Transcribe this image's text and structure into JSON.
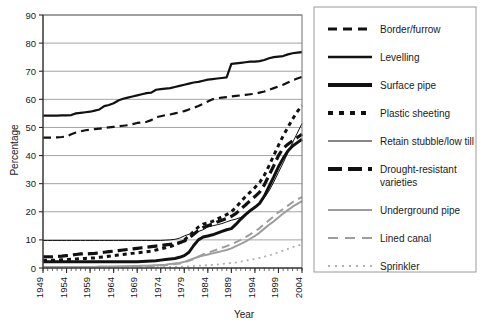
{
  "chart_data": {
    "type": "line",
    "title": "",
    "xlabel": "Year",
    "ylabel": "Percentage",
    "xlim": [
      1949,
      2004
    ],
    "ylim": [
      0,
      90
    ],
    "ytick_step": 10,
    "xtick_step": 5,
    "grid": true,
    "legend_position": "right",
    "xticks": [
      "1949",
      "1954",
      "1959",
      "1964",
      "1969",
      "1974",
      "1979",
      "1984",
      "1989",
      "1994",
      "1999",
      "2004"
    ],
    "yticks": [
      "0",
      "10",
      "20",
      "30",
      "40",
      "50",
      "60",
      "70",
      "80",
      "90"
    ],
    "x": [
      1949,
      1950,
      1951,
      1952,
      1953,
      1954,
      1955,
      1956,
      1957,
      1958,
      1959,
      1960,
      1961,
      1962,
      1963,
      1964,
      1965,
      1966,
      1967,
      1968,
      1969,
      1970,
      1971,
      1972,
      1973,
      1974,
      1975,
      1976,
      1977,
      1978,
      1979,
      1980,
      1981,
      1982,
      1983,
      1984,
      1985,
      1986,
      1987,
      1988,
      1989,
      1990,
      1991,
      1992,
      1993,
      1994,
      1995,
      1996,
      1997,
      1998,
      1999,
      2000,
      2001,
      2002,
      2003,
      2004
    ],
    "series": [
      {
        "name": "Levelling",
        "style": "solid",
        "color": "#111111",
        "width": 2.2,
        "dash": "none",
        "values": [
          54.2,
          54.2,
          54.2,
          54.2,
          54.3,
          54.3,
          54.4,
          55.0,
          55.2,
          55.4,
          55.6,
          56.0,
          56.4,
          57.6,
          58.0,
          58.6,
          59.6,
          60.2,
          60.6,
          61.0,
          61.4,
          61.8,
          62.2,
          62.4,
          63.4,
          63.6,
          63.8,
          64.0,
          64.4,
          64.8,
          65.2,
          65.6,
          66.0,
          66.2,
          66.6,
          67.0,
          67.2,
          67.4,
          67.6,
          67.8,
          72.6,
          72.8,
          73.0,
          73.2,
          73.4,
          73.4,
          73.6,
          74.0,
          74.6,
          75.0,
          75.2,
          75.4,
          76.0,
          76.4,
          76.6,
          76.8
        ]
      },
      {
        "name": "Border/furrow",
        "style": "dashed",
        "color": "#111111",
        "width": 2.2,
        "dash": "8,5",
        "values": [
          46.4,
          46.4,
          46.4,
          46.5,
          46.6,
          46.8,
          47.6,
          48.2,
          48.6,
          49.0,
          49.2,
          49.4,
          49.6,
          49.8,
          50.0,
          50.2,
          50.4,
          50.6,
          50.8,
          51.2,
          51.6,
          51.8,
          52.0,
          52.6,
          53.6,
          54.0,
          54.4,
          54.6,
          55.0,
          55.4,
          55.8,
          56.4,
          57.0,
          57.6,
          58.4,
          59.2,
          60.0,
          60.4,
          60.6,
          60.8,
          61.0,
          61.2,
          61.4,
          61.6,
          61.8,
          62.0,
          62.4,
          62.8,
          63.4,
          64.0,
          64.6,
          65.2,
          66.0,
          66.8,
          67.4,
          68.0
        ]
      },
      {
        "name": "Retain stubble/low till",
        "style": "thin-solid",
        "color": "#111111",
        "width": 1.0,
        "dash": "none",
        "values": [
          9.8,
          9.8,
          9.8,
          9.8,
          9.8,
          9.8,
          9.8,
          9.8,
          9.8,
          9.8,
          9.8,
          9.8,
          9.8,
          9.8,
          9.8,
          9.8,
          9.8,
          9.8,
          9.8,
          9.8,
          9.8,
          9.8,
          9.8,
          9.8,
          9.8,
          9.8,
          9.9,
          10.0,
          10.2,
          10.6,
          11.4,
          12.0,
          12.4,
          13.0,
          13.6,
          14.6,
          15.0,
          15.4,
          15.8,
          16.4,
          17.0,
          17.4,
          18.0,
          19.0,
          20.0,
          21.4,
          23.0,
          25.0,
          27.4,
          30.6,
          34.0,
          37.4,
          41.0,
          44.6,
          48.0,
          51.4
        ]
      },
      {
        "name": "Drought-resistant varieties",
        "style": "heavy-dashed",
        "color": "#111111",
        "width": 3.2,
        "dash": "10,5",
        "values": [
          4.0,
          4.0,
          4.0,
          4.1,
          4.2,
          4.4,
          4.6,
          4.8,
          5.0,
          5.0,
          5.1,
          5.2,
          5.4,
          5.6,
          5.8,
          6.0,
          6.2,
          6.4,
          6.6,
          6.8,
          7.0,
          7.2,
          7.4,
          7.6,
          7.8,
          8.0,
          8.2,
          8.4,
          8.6,
          9.0,
          9.6,
          10.6,
          12.0,
          13.4,
          14.4,
          15.0,
          15.6,
          16.4,
          17.0,
          17.6,
          18.4,
          19.4,
          21.0,
          22.4,
          24.0,
          25.4,
          27.0,
          29.6,
          33.0,
          36.4,
          40.0,
          42.6,
          44.0,
          45.2,
          46.4,
          47.6
        ]
      },
      {
        "name": "Surface pipe",
        "style": "heavy-solid",
        "color": "#111111",
        "width": 3.0,
        "dash": "none",
        "values": [
          2.2,
          2.2,
          2.2,
          2.2,
          2.2,
          2.2,
          2.2,
          2.2,
          2.2,
          2.2,
          2.2,
          2.2,
          2.2,
          2.2,
          2.2,
          2.2,
          2.2,
          2.2,
          2.2,
          2.2,
          2.2,
          2.3,
          2.4,
          2.5,
          2.6,
          2.8,
          3.0,
          3.2,
          3.4,
          3.8,
          4.4,
          5.6,
          8.0,
          10.0,
          11.0,
          11.4,
          11.8,
          12.4,
          13.0,
          13.6,
          14.0,
          15.6,
          17.4,
          19.0,
          20.4,
          21.6,
          23.0,
          25.6,
          29.0,
          32.4,
          36.0,
          39.0,
          41.6,
          43.4,
          44.6,
          45.8
        ]
      },
      {
        "name": "Plastic sheeting",
        "style": "dotted-dash",
        "color": "#111111",
        "width": 3.0,
        "dash": "4,4",
        "values": [
          2.8,
          2.8,
          2.8,
          2.8,
          2.9,
          3.0,
          3.1,
          3.2,
          3.3,
          3.4,
          3.5,
          3.6,
          3.8,
          4.0,
          4.2,
          4.4,
          4.6,
          4.8,
          5.0,
          5.2,
          5.4,
          5.6,
          5.8,
          6.0,
          6.4,
          6.8,
          7.2,
          7.6,
          8.2,
          9.0,
          10.0,
          11.4,
          13.0,
          14.6,
          15.6,
          16.0,
          16.6,
          17.4,
          18.2,
          19.0,
          20.0,
          21.6,
          23.6,
          25.4,
          27.0,
          28.6,
          30.4,
          33.0,
          36.4,
          40.0,
          43.6,
          47.0,
          50.0,
          53.0,
          55.6,
          57.8
        ]
      },
      {
        "name": "Underground pipe",
        "style": "gray-solid",
        "color": "#9d9d9d",
        "width": 2.0,
        "dash": "none",
        "values": [
          0.4,
          0.4,
          0.4,
          0.4,
          0.4,
          0.4,
          0.4,
          0.4,
          0.4,
          0.4,
          0.4,
          0.4,
          0.5,
          0.5,
          0.5,
          0.5,
          0.6,
          0.6,
          0.6,
          0.7,
          0.7,
          0.8,
          0.8,
          0.9,
          1.0,
          1.1,
          1.2,
          1.4,
          1.6,
          1.8,
          2.2,
          2.8,
          3.4,
          4.0,
          4.4,
          4.8,
          5.2,
          5.6,
          6.0,
          6.4,
          7.0,
          7.8,
          8.6,
          9.4,
          10.4,
          11.4,
          12.6,
          14.0,
          15.4,
          16.6,
          18.0,
          19.4,
          20.6,
          21.8,
          22.8,
          23.8
        ]
      },
      {
        "name": "Lined canal",
        "style": "gray-dashed",
        "color": "#9d9d9d",
        "width": 2.0,
        "dash": "8,5",
        "values": [
          0.3,
          0.3,
          0.3,
          0.3,
          0.3,
          0.3,
          0.3,
          0.3,
          0.3,
          0.3,
          0.3,
          0.3,
          0.3,
          0.4,
          0.4,
          0.4,
          0.4,
          0.4,
          0.5,
          0.5,
          0.5,
          0.6,
          0.6,
          0.7,
          0.8,
          0.9,
          1.0,
          1.2,
          1.4,
          1.6,
          2.0,
          2.6,
          3.2,
          4.0,
          4.8,
          5.4,
          6.0,
          6.6,
          7.2,
          7.8,
          8.4,
          9.2,
          10.0,
          11.0,
          12.0,
          13.0,
          14.2,
          15.6,
          17.0,
          18.4,
          19.8,
          21.0,
          22.2,
          23.4,
          24.4,
          25.2
        ]
      },
      {
        "name": "Sprinkler",
        "style": "gray-dotted",
        "color": "#b0b0b0",
        "width": 1.8,
        "dash": "2,4",
        "values": [
          0.1,
          0.1,
          0.1,
          0.1,
          0.1,
          0.1,
          0.1,
          0.1,
          0.1,
          0.1,
          0.1,
          0.1,
          0.1,
          0.1,
          0.1,
          0.1,
          0.1,
          0.1,
          0.2,
          0.2,
          0.2,
          0.2,
          0.2,
          0.2,
          0.3,
          0.3,
          0.3,
          0.4,
          0.4,
          0.5,
          0.5,
          0.6,
          0.7,
          0.8,
          0.9,
          1.0,
          1.1,
          1.2,
          1.4,
          1.6,
          1.8,
          2.0,
          2.3,
          2.6,
          2.9,
          3.2,
          3.6,
          4.0,
          4.5,
          5.0,
          5.6,
          6.2,
          6.8,
          7.4,
          7.9,
          8.4
        ]
      }
    ],
    "legend": [
      {
        "label": "Border/furrow",
        "style": "dashed",
        "color": "#111111",
        "width": 3.0,
        "dash": "9,6"
      },
      {
        "label": "Levelling",
        "style": "solid",
        "color": "#111111",
        "width": 2.6,
        "dash": "none"
      },
      {
        "label": "Surface pipe",
        "style": "heavy-solid",
        "color": "#111111",
        "width": 4.2,
        "dash": "none"
      },
      {
        "label": "Plastic sheeting",
        "style": "dotted-dash",
        "color": "#111111",
        "width": 4.0,
        "dash": "5,6"
      },
      {
        "label": "Retain stubble/low till",
        "style": "thin-solid",
        "color": "#111111",
        "width": 1.2,
        "dash": "none"
      },
      {
        "label": "Drought-resistant varieties",
        "style": "heavy-dashed",
        "color": "#111111",
        "width": 4.2,
        "dash": "14,6"
      },
      {
        "label": "Underground pipe",
        "style": "gray-solid",
        "color": "#9d9d9d",
        "width": 1.8,
        "dash": "none"
      },
      {
        "label": "Lined canal",
        "style": "gray-dashed",
        "color": "#9d9d9d",
        "width": 2.2,
        "dash": "10,7"
      },
      {
        "label": "Sprinkler",
        "style": "gray-dotted",
        "color": "#b0b0b0",
        "width": 2.0,
        "dash": "2,5"
      }
    ]
  }
}
